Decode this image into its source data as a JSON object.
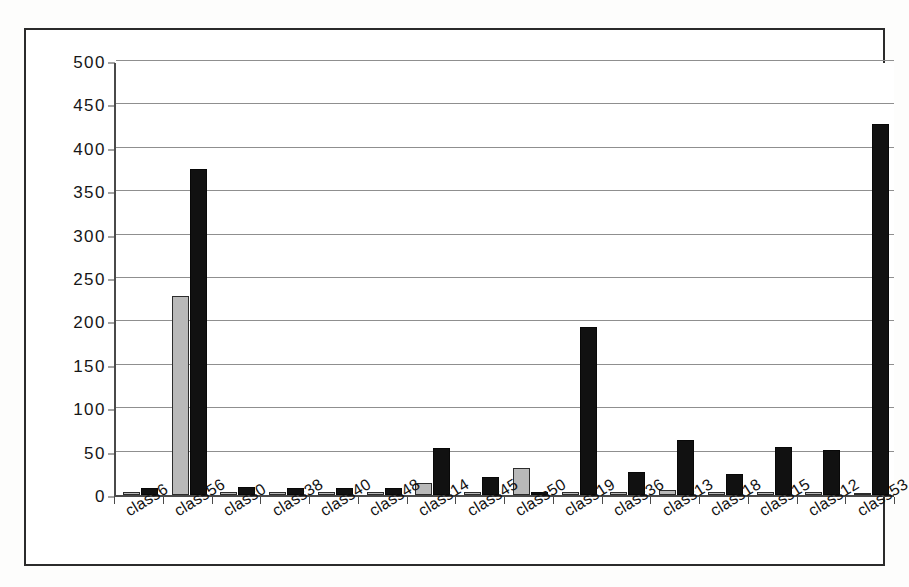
{
  "chart_data": {
    "type": "bar",
    "title": "",
    "subtitle": "",
    "xlabel": "",
    "ylabel": "",
    "ylim": [
      0,
      500
    ],
    "ytick_step": 50,
    "yticks": [
      0,
      50,
      100,
      150,
      200,
      250,
      300,
      350,
      400,
      450,
      500
    ],
    "ytick_labels": [
      "0",
      "50",
      "100",
      "150",
      "200",
      "250",
      "300",
      "350",
      "400",
      "450",
      "500"
    ],
    "grid": true,
    "grid_axis": "y",
    "legend": "none",
    "legend_position": "none",
    "annotations": [],
    "categories": [
      "class6",
      "class56",
      "class0",
      "class38",
      "class40",
      "class48",
      "class14",
      "class45",
      "class50",
      "class19",
      "class36",
      "class13",
      "class18",
      "class15",
      "class12",
      "class53"
    ],
    "series": [
      {
        "name": "series-gray",
        "color": "#b9b9b9",
        "values": [
          4,
          229,
          4,
          4,
          4,
          4,
          14,
          4,
          31,
          3,
          3,
          6,
          3,
          3,
          4,
          2
        ]
      },
      {
        "name": "series-black",
        "color": "#111111",
        "values": [
          8,
          376,
          9,
          8,
          8,
          8,
          54,
          21,
          4,
          194,
          26,
          63,
          24,
          55,
          52,
          428
        ]
      }
    ]
  },
  "axis": {
    "y_axis_name": "value-axis",
    "x_axis_name": "category-axis"
  }
}
